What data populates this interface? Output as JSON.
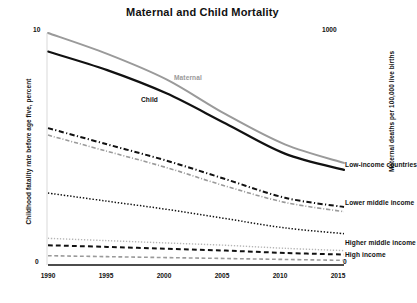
{
  "chart_data": {
    "type": "line",
    "title": "Maternal and Child Mortality",
    "xlabel": "",
    "ylabel": "Childhood fatality rate before age five, percent",
    "ylabel_right": "Maternal deaths per 100,000 live births",
    "x": [
      1990,
      1995,
      2000,
      2005,
      2010,
      2015
    ],
    "xtick_labels": [
      "1990",
      "1995",
      "2000",
      "2005",
      "2010",
      "2015"
    ],
    "xlim": [
      1990,
      2015
    ],
    "ylim": [
      0,
      10
    ],
    "ylim_right": [
      0,
      1000
    ],
    "ytick_labels_left": [
      "10",
      "0"
    ],
    "ytick_labels_right": [
      "1000",
      "0"
    ],
    "grid": false,
    "legend_position": "inline-right",
    "annotations": [
      {
        "text": "Maternal",
        "color": "#9a9a9a",
        "x": 2000,
        "y": 7.0
      },
      {
        "text": "Child",
        "color": "#111111",
        "x": 1998,
        "y": 6.2
      }
    ],
    "series": [
      {
        "name": "World child mortality",
        "label": "Child",
        "color": "#111111",
        "style": "solid",
        "width": 2.2,
        "axis": "left",
        "values": [
          9.2,
          8.4,
          7.4,
          6.1,
          4.8,
          4.1
        ]
      },
      {
        "name": "World maternal mortality",
        "label": "Maternal",
        "color": "#9a9a9a",
        "style": "solid",
        "width": 2.0,
        "axis": "right",
        "values": [
          1000,
          910,
          800,
          650,
          520,
          440
        ]
      },
      {
        "name": "Low-income countries child",
        "label": "Low-income countries",
        "color": "#111111",
        "style": "dashdot",
        "width": 2.0,
        "axis": "left",
        "values": [
          5.9,
          5.2,
          4.5,
          3.7,
          2.9,
          2.5
        ]
      },
      {
        "name": "Low-income countries maternal",
        "label": "Low-income countries",
        "color": "#9a9a9a",
        "style": "dashdot",
        "width": 1.6,
        "axis": "right",
        "values": [
          560,
          490,
          420,
          340,
          270,
          230
        ]
      },
      {
        "name": "Lower middle income child",
        "label": "Lower middle income",
        "color": "#111111",
        "style": "dotted",
        "width": 1.5,
        "axis": "left",
        "values": [
          3.1,
          2.75,
          2.4,
          2.0,
          1.6,
          1.35
        ]
      },
      {
        "name": "Higher middle income child",
        "label": "Higher middle income",
        "color": "#b5b5b5",
        "style": "dotted",
        "width": 1.4,
        "axis": "left",
        "values": [
          1.15,
          1.05,
          0.95,
          0.85,
          0.72,
          0.62
        ]
      },
      {
        "name": "High income child",
        "label": "High income",
        "color": "#111111",
        "style": "dashed",
        "width": 2.0,
        "axis": "left",
        "values": [
          0.85,
          0.78,
          0.7,
          0.62,
          0.52,
          0.45
        ]
      },
      {
        "name": "High income maternal",
        "label": "High income",
        "color": "#9a9a9a",
        "style": "dashed",
        "width": 1.6,
        "axis": "right",
        "values": [
          40,
          36,
          32,
          28,
          24,
          20
        ]
      }
    ],
    "right_labels": [
      {
        "text": "Low-income countries",
        "y_px": 164
      },
      {
        "text": "Lower middle income",
        "y_px": 202
      },
      {
        "text": "Higher middle income",
        "y_px": 242
      },
      {
        "text": "High income",
        "y_px": 254
      }
    ]
  }
}
